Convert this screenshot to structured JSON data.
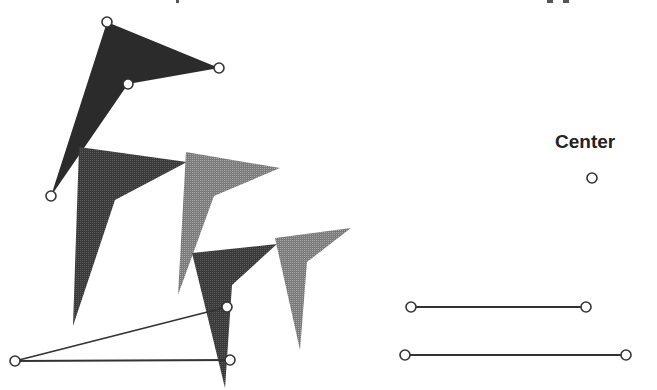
{
  "colors": {
    "dark_fill": "#2b2b2b",
    "mid_fill": "#4a4a4a",
    "light_fill": "#8c8c8c",
    "stroke": "#333333",
    "handle_fill": "#ffffff"
  },
  "labels": {
    "center": "Center"
  },
  "shapes": [
    {
      "name": "arrowhead-1",
      "shade": "dark",
      "points": [
        [
          107,
          22
        ],
        [
          219,
          68
        ],
        [
          128,
          84
        ],
        [
          51,
          196
        ]
      ],
      "handles": true
    },
    {
      "name": "arrowhead-2",
      "shade": "mid",
      "points": [
        [
          79,
          147
        ],
        [
          187,
          162
        ],
        [
          115,
          200
        ],
        [
          73,
          326
        ]
      ],
      "handles": false
    },
    {
      "name": "arrowhead-3",
      "shade": "light",
      "points": [
        [
          186,
          152
        ],
        [
          280,
          168
        ],
        [
          214,
          196
        ],
        [
          178,
          295
        ]
      ],
      "handles": false
    },
    {
      "name": "arrowhead-4",
      "shade": "mid",
      "points": [
        [
          192,
          253
        ],
        [
          277,
          244
        ],
        [
          232,
          285
        ],
        [
          225,
          388
        ]
      ],
      "handles": false
    },
    {
      "name": "arrowhead-5",
      "shade": "light",
      "points": [
        [
          275,
          238
        ],
        [
          351,
          228
        ],
        [
          307,
          262
        ],
        [
          300,
          350
        ]
      ],
      "handles": false
    }
  ],
  "lines": [
    {
      "name": "angle-ray-upper",
      "from": [
        15,
        361
      ],
      "to": [
        227,
        307
      ]
    },
    {
      "name": "angle-ray-lower",
      "from": [
        15,
        361
      ],
      "to": [
        230,
        360
      ]
    },
    {
      "name": "segment-short",
      "from": [
        411,
        307
      ],
      "to": [
        586,
        307
      ]
    },
    {
      "name": "segment-long",
      "from": [
        405,
        355
      ],
      "to": [
        626,
        355
      ]
    }
  ],
  "points": [
    {
      "name": "center-point",
      "at": [
        592,
        178
      ]
    }
  ]
}
